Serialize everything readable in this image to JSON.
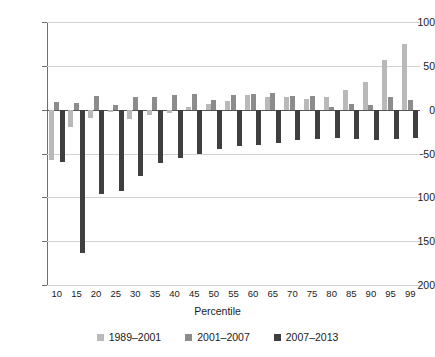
{
  "chart_data": {
    "type": "bar",
    "title": "",
    "subtitle": "",
    "xlabel": "Percentile",
    "ylabel": "",
    "ylim": [
      -200,
      100
    ],
    "ytick_values": [
      100,
      50,
      0,
      -50,
      -100,
      -150,
      -200
    ],
    "ytick_labels": [
      "100",
      "50",
      "0",
      "−50",
      "−100",
      "−150",
      "−200"
    ],
    "grid": true,
    "legend_position": "bottom",
    "categories": [
      "10",
      "15",
      "20",
      "25",
      "30",
      "35",
      "40",
      "45",
      "50",
      "55",
      "60",
      "65",
      "70",
      "75",
      "80",
      "85",
      "90",
      "95",
      "99"
    ],
    "series": [
      {
        "name": "1989–2001",
        "color": "#b9b9b9",
        "values": [
          -57,
          -20,
          -10,
          -3,
          -11,
          -6,
          -4,
          3,
          6,
          10,
          17,
          14,
          15,
          12,
          14,
          23,
          31,
          57,
          75
        ]
      },
      {
        "name": "2001–2007",
        "color": "#8c8c8c",
        "values": [
          9,
          8,
          16,
          5,
          14,
          14,
          17,
          18,
          11,
          17,
          18,
          19,
          16,
          16,
          3,
          7,
          5,
          15,
          11
        ]
      },
      {
        "name": "2007–2013",
        "color": "#3f3f3f",
        "values": [
          -60,
          -163,
          -96,
          -93,
          -76,
          -61,
          -55,
          -51,
          -45,
          -42,
          -40,
          -38,
          -35,
          -34,
          -32,
          -34,
          -35,
          -34,
          -32
        ]
      }
    ]
  },
  "axis": {
    "x_title": "Percentile"
  },
  "legend": {
    "items": [
      {
        "label": "1989–2001",
        "color": "#b9b9b9"
      },
      {
        "label": "2001–2007",
        "color": "#8c8c8c"
      },
      {
        "label": "2007–2013",
        "color": "#3f3f3f"
      }
    ]
  }
}
